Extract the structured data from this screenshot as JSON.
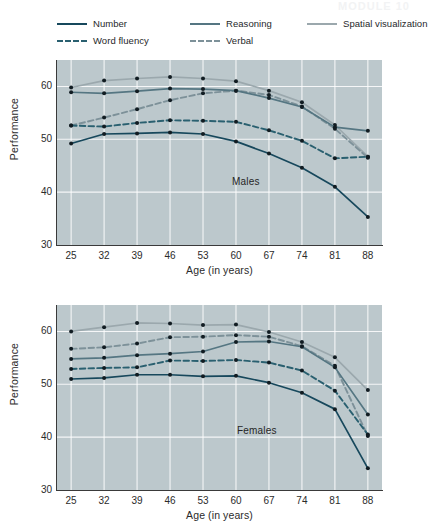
{
  "header": {
    "artifact_title": "MODULE 10",
    "artifact_sub": "Adult Development and Aging"
  },
  "legend": {
    "items": [
      {
        "label": "Number",
        "color": "#17485c",
        "style": "solid",
        "name": "legend-number"
      },
      {
        "label": "Reasoning",
        "color": "#557682",
        "style": "solid",
        "name": "legend-reasoning"
      },
      {
        "label": "Spatial visualization",
        "color": "#9ba8ad",
        "style": "solid",
        "name": "legend-spatial-visualization"
      },
      {
        "label": "Word fluency",
        "color": "#2a6070",
        "style": "dashed",
        "name": "legend-word-fluency"
      },
      {
        "label": "Verbal",
        "color": "#7d9199",
        "style": "dashed",
        "name": "legend-verbal"
      }
    ]
  },
  "panels": [
    {
      "id": "males",
      "tag": "Males",
      "xlabel": "Age (in years)",
      "ylabel": "Performance"
    },
    {
      "id": "females",
      "tag": "Females",
      "xlabel": "Age (in years)",
      "ylabel": "Performance"
    }
  ],
  "axis": {
    "x_ticks": [
      "25",
      "32",
      "39",
      "46",
      "53",
      "60",
      "67",
      "74",
      "81",
      "88"
    ],
    "y_ticks": [
      "30",
      "40",
      "50",
      "60"
    ]
  },
  "chart_data": [
    {
      "type": "line",
      "title": "Males",
      "xlabel": "Age (in years)",
      "ylabel": "Performance",
      "x": [
        25,
        32,
        39,
        46,
        53,
        60,
        67,
        74,
        81,
        88
      ],
      "xlim": [
        22,
        91
      ],
      "ylim": [
        30,
        65
      ],
      "grid": true,
      "legend_position": "top",
      "series": [
        {
          "name": "Number",
          "color": "#17485c",
          "style": "solid",
          "values": [
            49.2,
            51.0,
            51.1,
            51.3,
            51.0,
            49.6,
            47.3,
            44.6,
            41.0,
            35.3
          ]
        },
        {
          "name": "Word fluency",
          "color": "#2a6070",
          "style": "dashed",
          "values": [
            52.6,
            52.4,
            53.1,
            53.6,
            53.5,
            53.3,
            51.7,
            49.7,
            46.4,
            46.7
          ]
        },
        {
          "name": "Reasoning",
          "color": "#557682",
          "style": "solid",
          "values": [
            58.9,
            58.7,
            59.1,
            59.6,
            59.5,
            59.2,
            57.8,
            56.1,
            52.3,
            51.6
          ]
        },
        {
          "name": "Verbal",
          "color": "#7d9199",
          "style": "dashed",
          "values": [
            52.6,
            54.1,
            55.7,
            57.4,
            58.7,
            59.2,
            58.4,
            56.2,
            52.0,
            46.5
          ]
        },
        {
          "name": "Spatial visualization",
          "color": "#9ba8ad",
          "style": "solid",
          "values": [
            59.8,
            61.1,
            61.5,
            61.8,
            61.5,
            61.0,
            59.2,
            57.0,
            52.7,
            46.7
          ]
        }
      ]
    },
    {
      "type": "line",
      "title": "Females",
      "xlabel": "Age (in years)",
      "ylabel": "Performance",
      "x": [
        25,
        32,
        39,
        46,
        53,
        60,
        67,
        74,
        81,
        88
      ],
      "xlim": [
        22,
        91
      ],
      "ylim": [
        30,
        65
      ],
      "grid": true,
      "legend_position": "top",
      "series": [
        {
          "name": "Number",
          "color": "#17485c",
          "style": "solid",
          "values": [
            51.0,
            51.2,
            51.8,
            51.8,
            51.5,
            51.6,
            50.3,
            48.4,
            45.3,
            34.1
          ]
        },
        {
          "name": "Word fluency",
          "color": "#2a6070",
          "style": "dashed",
          "values": [
            52.9,
            53.1,
            53.2,
            54.5,
            54.4,
            54.6,
            54.1,
            52.6,
            48.8,
            40.5
          ]
        },
        {
          "name": "Reasoning",
          "color": "#557682",
          "style": "solid",
          "values": [
            54.8,
            55.0,
            55.5,
            55.8,
            56.2,
            58.0,
            58.1,
            57.1,
            53.2,
            44.3
          ]
        },
        {
          "name": "Verbal",
          "color": "#7d9199",
          "style": "dashed",
          "values": [
            56.7,
            57.0,
            57.7,
            58.9,
            59.0,
            59.3,
            59.0,
            57.2,
            53.5,
            40.2
          ]
        },
        {
          "name": "Spatial visualization",
          "color": "#9ba8ad",
          "style": "solid",
          "values": [
            60.0,
            60.8,
            61.6,
            61.5,
            61.2,
            61.3,
            59.9,
            58.0,
            55.1,
            48.9
          ]
        }
      ]
    }
  ]
}
